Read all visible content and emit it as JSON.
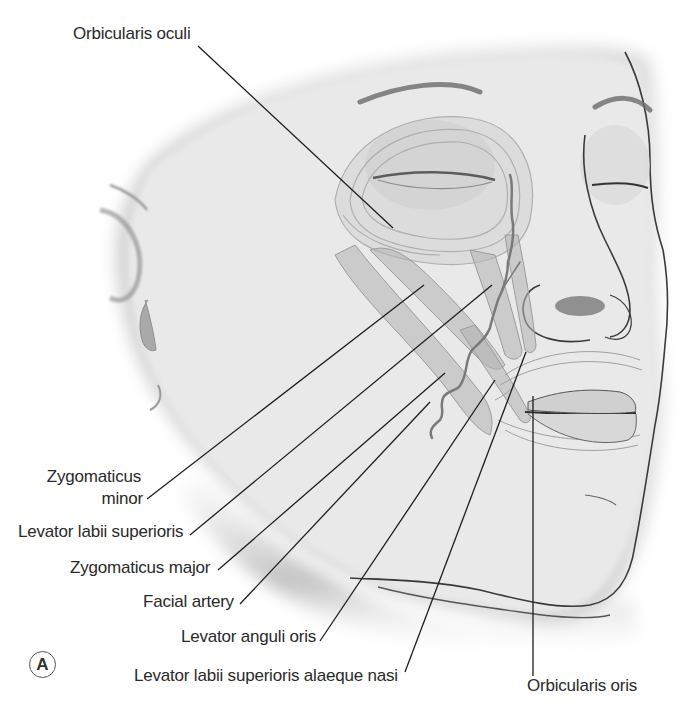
{
  "figure": {
    "panel_label": "A",
    "colors": {
      "skin": "#e6e6e6",
      "skin_shadow": "#9a9a9a",
      "muscle": "#b8b8b8",
      "outline": "#3a3a3a",
      "leader": "#1e1e1e",
      "text": "#2a2a2a"
    }
  },
  "labels": [
    {
      "id": "orbicularis-oculi",
      "text": "Orbicularis oculi"
    },
    {
      "id": "zygomaticus-minor-1",
      "text": "Zygomaticus"
    },
    {
      "id": "zygomaticus-minor-2",
      "text": "minor"
    },
    {
      "id": "levator-labii-superioris",
      "text": "Levator labii superioris"
    },
    {
      "id": "zygomaticus-major",
      "text": "Zygomaticus major"
    },
    {
      "id": "facial-artery",
      "text": "Facial artery"
    },
    {
      "id": "levator-anguli-oris",
      "text": "Levator anguli oris"
    },
    {
      "id": "levator-labii-superioris-alaeque-nasi",
      "text": "Levator labii superioris alaeque nasi"
    },
    {
      "id": "orbicularis-oris",
      "text": "Orbicularis oris"
    }
  ]
}
